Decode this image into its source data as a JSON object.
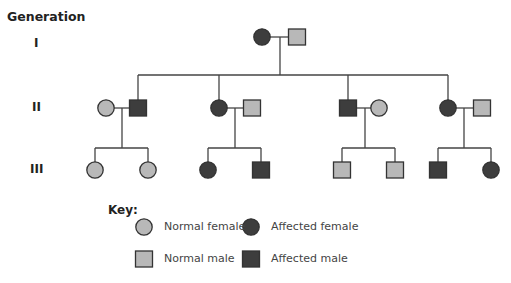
{
  "title": "Generation",
  "generations": [
    {
      "label": "I",
      "y": 44
    },
    {
      "label": "II",
      "y": 108
    },
    {
      "label": "III",
      "y": 170
    }
  ],
  "colors": {
    "normal": "#b8b8b8",
    "affected": "#3d3d3d",
    "stroke": "#333333",
    "line": "#444444"
  },
  "individuals": [
    {
      "id": "I-1",
      "gen": "I",
      "sex": "female",
      "status": "affected",
      "x": 262,
      "y": 37
    },
    {
      "id": "I-2",
      "gen": "I",
      "sex": "male",
      "status": "normal",
      "x": 297,
      "y": 37
    },
    {
      "id": "II-1",
      "gen": "II",
      "sex": "female",
      "status": "normal",
      "x": 106,
      "y": 108
    },
    {
      "id": "II-2",
      "gen": "II",
      "sex": "male",
      "status": "affected",
      "x": 138,
      "y": 108
    },
    {
      "id": "II-3",
      "gen": "II",
      "sex": "female",
      "status": "affected",
      "x": 219,
      "y": 108
    },
    {
      "id": "II-4",
      "gen": "II",
      "sex": "male",
      "status": "normal",
      "x": 252,
      "y": 108
    },
    {
      "id": "II-5",
      "gen": "II",
      "sex": "male",
      "status": "affected",
      "x": 348,
      "y": 108
    },
    {
      "id": "II-6",
      "gen": "II",
      "sex": "female",
      "status": "normal",
      "x": 379,
      "y": 108
    },
    {
      "id": "II-7",
      "gen": "II",
      "sex": "female",
      "status": "affected",
      "x": 448,
      "y": 108
    },
    {
      "id": "II-8",
      "gen": "II",
      "sex": "male",
      "status": "normal",
      "x": 482,
      "y": 108
    },
    {
      "id": "III-1",
      "gen": "III",
      "sex": "female",
      "status": "normal",
      "x": 95,
      "y": 170
    },
    {
      "id": "III-2",
      "gen": "III",
      "sex": "female",
      "status": "normal",
      "x": 148,
      "y": 170
    },
    {
      "id": "III-3",
      "gen": "III",
      "sex": "female",
      "status": "affected",
      "x": 208,
      "y": 170
    },
    {
      "id": "III-4",
      "gen": "III",
      "sex": "male",
      "status": "affected",
      "x": 261,
      "y": 170
    },
    {
      "id": "III-5",
      "gen": "III",
      "sex": "male",
      "status": "normal",
      "x": 342,
      "y": 170
    },
    {
      "id": "III-6",
      "gen": "III",
      "sex": "male",
      "status": "normal",
      "x": 395,
      "y": 170
    },
    {
      "id": "III-7",
      "gen": "III",
      "sex": "male",
      "status": "affected",
      "x": 438,
      "y": 170
    },
    {
      "id": "III-8",
      "gen": "III",
      "sex": "female",
      "status": "affected",
      "x": 491,
      "y": 170
    }
  ],
  "lines": [
    {
      "x1": 270,
      "y1": 37,
      "x2": 288,
      "y2": 37
    },
    {
      "x1": 280,
      "y1": 37,
      "x2": 280,
      "y2": 75
    },
    {
      "x1": 138,
      "y1": 75,
      "x2": 448,
      "y2": 75
    },
    {
      "x1": 138,
      "y1": 75,
      "x2": 138,
      "y2": 100
    },
    {
      "x1": 219,
      "y1": 75,
      "x2": 219,
      "y2": 100
    },
    {
      "x1": 348,
      "y1": 75,
      "x2": 348,
      "y2": 100
    },
    {
      "x1": 448,
      "y1": 75,
      "x2": 448,
      "y2": 100
    },
    {
      "x1": 114,
      "y1": 108,
      "x2": 129,
      "y2": 108
    },
    {
      "x1": 122,
      "y1": 108,
      "x2": 122,
      "y2": 148
    },
    {
      "x1": 95,
      "y1": 148,
      "x2": 148,
      "y2": 148
    },
    {
      "x1": 95,
      "y1": 148,
      "x2": 95,
      "y2": 162
    },
    {
      "x1": 148,
      "y1": 148,
      "x2": 148,
      "y2": 162
    },
    {
      "x1": 227,
      "y1": 108,
      "x2": 243,
      "y2": 108
    },
    {
      "x1": 235,
      "y1": 108,
      "x2": 235,
      "y2": 148
    },
    {
      "x1": 208,
      "y1": 148,
      "x2": 261,
      "y2": 148
    },
    {
      "x1": 208,
      "y1": 148,
      "x2": 208,
      "y2": 162
    },
    {
      "x1": 261,
      "y1": 148,
      "x2": 261,
      "y2": 162
    },
    {
      "x1": 357,
      "y1": 108,
      "x2": 371,
      "y2": 108
    },
    {
      "x1": 365,
      "y1": 108,
      "x2": 365,
      "y2": 148
    },
    {
      "x1": 342,
      "y1": 148,
      "x2": 395,
      "y2": 148
    },
    {
      "x1": 342,
      "y1": 148,
      "x2": 342,
      "y2": 162
    },
    {
      "x1": 395,
      "y1": 148,
      "x2": 395,
      "y2": 162
    },
    {
      "x1": 456,
      "y1": 108,
      "x2": 473,
      "y2": 108
    },
    {
      "x1": 464,
      "y1": 108,
      "x2": 464,
      "y2": 148
    },
    {
      "x1": 438,
      "y1": 148,
      "x2": 491,
      "y2": 148
    },
    {
      "x1": 438,
      "y1": 148,
      "x2": 438,
      "y2": 162
    },
    {
      "x1": 491,
      "y1": 148,
      "x2": 491,
      "y2": 162
    }
  ],
  "key": {
    "title": "Key:",
    "items": [
      {
        "sex": "female",
        "status": "normal",
        "label": "Normal female",
        "x": 144,
        "y": 227
      },
      {
        "sex": "female",
        "status": "affected",
        "label": "Affected female",
        "x": 251,
        "y": 227
      },
      {
        "sex": "male",
        "status": "normal",
        "label": "Normal male",
        "x": 144,
        "y": 259
      },
      {
        "sex": "male",
        "status": "affected",
        "label": "Affected male",
        "x": 251,
        "y": 259
      }
    ]
  }
}
